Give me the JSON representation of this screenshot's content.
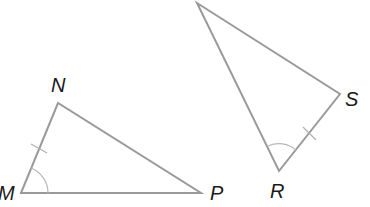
{
  "diagram": {
    "type": "geometry-congruent-triangles",
    "triangles": [
      {
        "name": "MNP",
        "vertices": [
          {
            "label": "M",
            "x": 21,
            "y": 193
          },
          {
            "label": "N",
            "x": 58,
            "y": 103
          },
          {
            "label": "P",
            "x": 201,
            "y": 193
          }
        ],
        "tick_marked_side": "MN",
        "angle_marked": "M"
      },
      {
        "name": "RS-triangle",
        "vertices": [
          {
            "label": "",
            "x": 197,
            "y": 3
          },
          {
            "label": "S",
            "x": 340,
            "y": 94
          },
          {
            "label": "R",
            "x": 279,
            "y": 171
          }
        ],
        "tick_marked_side": "RS",
        "angle_marked": "R"
      }
    ],
    "labels": {
      "M": "M",
      "N": "N",
      "P": "P",
      "R": "R",
      "S": "S"
    },
    "colors": {
      "edge": "#9a9a9a",
      "label": "#1a1a1a",
      "background": "#ffffff"
    }
  }
}
